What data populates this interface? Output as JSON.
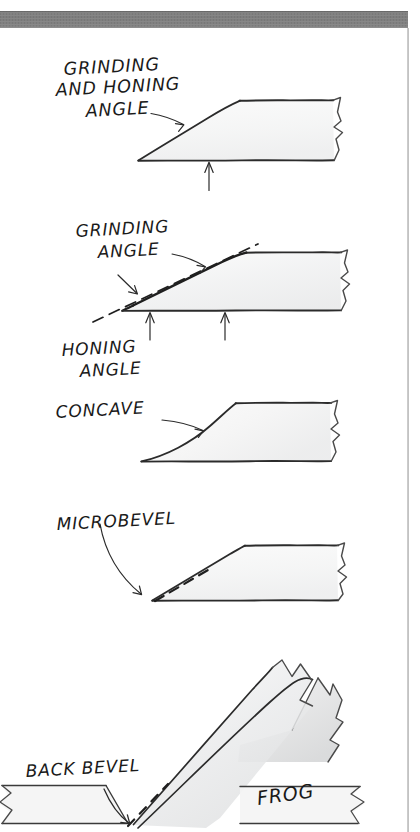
{
  "page": {
    "background_color": "#ffffff",
    "ink_color": "#1a1a1a",
    "scan_band_color": "#7a7a7a",
    "rule_color": "#9a9a9a",
    "shade_color": "#e8e8e8"
  },
  "figures": [
    {
      "id": "grinding-and-honing-angle",
      "label": "GRINDING\nAND HONING\nANGLE",
      "label_lines": [
        "GRINDING",
        "AND HONING",
        "ANGLE"
      ],
      "description": "Single flat bevel blade in profile with one arrow pointing at the bevel face and one arrow pointing up at the flat back."
    },
    {
      "id": "grinding-angle-honing-angle",
      "label_lines_top": [
        "GRINDING",
        "ANGLE"
      ],
      "label_lines_bottom": [
        "HONING",
        "ANGLE"
      ],
      "description": "Blade with a dashed extension line showing the grinding angle and a secondary honing angle at the cutting tip."
    },
    {
      "id": "concave",
      "label_lines": [
        "CONCAVE"
      ],
      "description": "Hollow-ground blade whose bevel face curves inward, drawn with a concave arc."
    },
    {
      "id": "microbevel",
      "label_lines": [
        "MICROBEVEL"
      ],
      "description": "Blade with a short dashed micro-bevel facet added right at the cutting edge."
    },
    {
      "id": "back-bevel-frog",
      "label_back_bevel": "BACK BEVEL",
      "label_frog": "FROG",
      "description": "Bevel-down blade seated on the frog of a hand plane, with a dashed back bevel at the tip resting on the sole."
    }
  ],
  "labels": {
    "grinding_and_honing_angle_l1": "GRINDING",
    "grinding_and_honing_angle_l2": "AND HONING",
    "grinding_and_honing_angle_l3": "ANGLE",
    "grinding_angle_l1": "GRINDING",
    "grinding_angle_l2": "ANGLE",
    "honing_angle_l1": "HONING",
    "honing_angle_l2": "ANGLE",
    "concave": "CONCAVE",
    "microbevel": "MICROBEVEL",
    "back_bevel": "BACK BEVEL",
    "frog": "FROG"
  }
}
